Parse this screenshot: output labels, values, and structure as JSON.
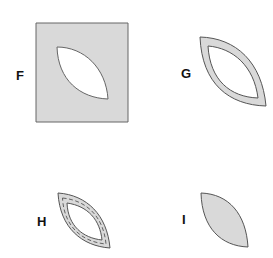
{
  "panels": [
    {
      "id": "F",
      "label": "F",
      "description": "gray square with leaf-shaped cutout"
    },
    {
      "id": "G",
      "label": "G",
      "description": "leaf-shaped outline band"
    },
    {
      "id": "H",
      "label": "H",
      "description": "leaf-shaped band with dashed stitching line"
    },
    {
      "id": "I",
      "label": "I",
      "description": "solid gray leaf shape"
    }
  ],
  "colors": {
    "fill": "#d9d9d9",
    "stroke": "#555555",
    "background": "#ffffff",
    "label": "#111111"
  }
}
